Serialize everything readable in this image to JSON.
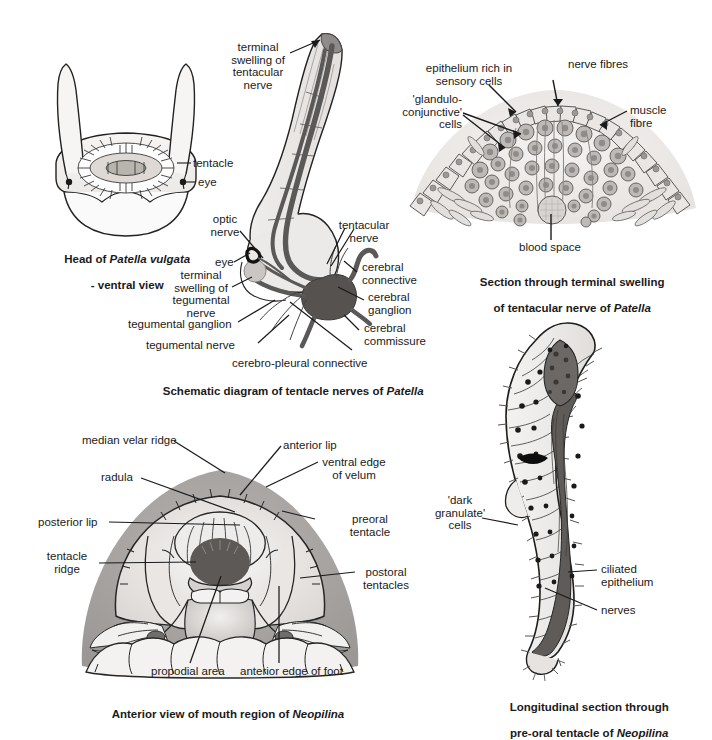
{
  "page": {
    "background": "#ffffff",
    "width": 712,
    "height": 722,
    "ink": "#1a1a1a"
  },
  "palette": {
    "tissue_light": "#f2f0ee",
    "tissue_mid": "#d8d5d2",
    "tissue_dark": "#9b9896",
    "nerve_dark": "#5b5957",
    "ganglion": "#555250",
    "shadow": "#b8b5b2",
    "outline": "#222222"
  },
  "figures": [
    {
      "id": "head-patella-ventral",
      "caption_line1": "Head of Patella vulgata",
      "caption_line2": "- ventral view",
      "caption_italic": "Patella vulgata",
      "labels": [
        {
          "name": "tentacle",
          "text": "tentacle"
        },
        {
          "name": "eye",
          "text": "eye"
        }
      ]
    },
    {
      "id": "schematic-tentacle-nerves",
      "caption_line1": "Schematic diagram of tentacle nerves of Patella",
      "caption_italic": "Patella",
      "labels": [
        {
          "name": "terminal-swelling-tentacular-nerve",
          "text": "terminal\nswelling of\ntentacular\nnerve"
        },
        {
          "name": "optic-nerve",
          "text": "optic\nnerve"
        },
        {
          "name": "eye",
          "text": "eye"
        },
        {
          "name": "terminal-swelling-tegumental-nerve",
          "text": "terminal\nswelling of\ntegumental\nnerve"
        },
        {
          "name": "tegumental-ganglion",
          "text": "tegumental ganglion"
        },
        {
          "name": "tegumental-nerve",
          "text": "tegumental nerve"
        },
        {
          "name": "cerebro-pleural-connective",
          "text": "cerebro-pleural connective"
        },
        {
          "name": "tentacular-nerve",
          "text": "tentacular\nnerve"
        },
        {
          "name": "cerebral-connective",
          "text": "cerebral\nconnective"
        },
        {
          "name": "cerebral-ganglion",
          "text": "cerebral\nganglion"
        },
        {
          "name": "cerebral-commissure",
          "text": "cerebral\ncommissure"
        }
      ]
    },
    {
      "id": "section-terminal-swelling",
      "caption_line1": "Section through terminal swelling",
      "caption_line2": "of tentacular nerve of Patella",
      "caption_italic": "Patella",
      "labels": [
        {
          "name": "epithelium-rich-in-sensory-cells",
          "text": "epithelium rich in\nsensory cells"
        },
        {
          "name": "nerve-fibres",
          "text": "nerve fibres"
        },
        {
          "name": "glandulo-conjunctive-cells",
          "text": "'glandulo-\nconjunctive'\ncells"
        },
        {
          "name": "muscle-fibre",
          "text": "muscle\nfibre"
        },
        {
          "name": "blood-space",
          "text": "blood space"
        }
      ]
    },
    {
      "id": "anterior-view-mouth-neopilina",
      "caption_line1": "Anterior view of mouth region of Neopilina",
      "caption_italic": "Neopilina",
      "labels": [
        {
          "name": "median-velar-ridge",
          "text": "median velar ridge"
        },
        {
          "name": "anterior-lip",
          "text": "anterior lip"
        },
        {
          "name": "radula",
          "text": "radula"
        },
        {
          "name": "ventral-edge-of-velum",
          "text": "ventral edge\nof velum"
        },
        {
          "name": "posterior-lip",
          "text": "posterior lip"
        },
        {
          "name": "preoral-tentacle",
          "text": "preoral\ntentacle"
        },
        {
          "name": "tentacle-ridge",
          "text": "tentacle\nridge"
        },
        {
          "name": "postoral-tentacles",
          "text": "postoral\ntentacles"
        },
        {
          "name": "propodial-area",
          "text": "propodial area"
        },
        {
          "name": "anterior-edge-of-foot",
          "text": "anterior edge of foot"
        }
      ]
    },
    {
      "id": "longitudinal-section-preoral-tentacle",
      "caption_line1": "Longitudinal section through",
      "caption_line2": "pre-oral tentacle of Neopilina",
      "caption_italic": "Neopilina",
      "labels": [
        {
          "name": "dark-granulate-cells",
          "text": "'dark\ngranulate'\ncells"
        },
        {
          "name": "ciliated-epithelium",
          "text": "ciliated\nepithelium"
        },
        {
          "name": "nerves",
          "text": "nerves"
        }
      ]
    }
  ]
}
